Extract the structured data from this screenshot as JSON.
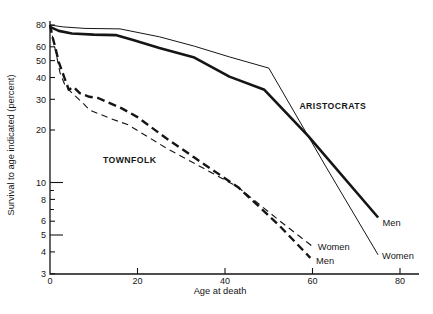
{
  "chart_data": {
    "type": "line",
    "title": "",
    "xlabel": "Age at death",
    "ylabel": "Survival to age indicated (percent)",
    "x_scale": "linear",
    "y_scale": "log",
    "xlim": [
      0,
      84
    ],
    "ylim": [
      3,
      80
    ],
    "x_ticks": [
      0,
      20,
      40,
      60,
      80
    ],
    "y_ticks": [
      80,
      60,
      50,
      40,
      30,
      20,
      10,
      8,
      6,
      5,
      4,
      3
    ],
    "y_long_ticks": [
      10,
      5
    ],
    "y_minor_ticks": [
      9,
      7
    ],
    "grid": false,
    "line_color": "#151515",
    "background_color": "#ffffff",
    "series": [
      {
        "name": "Aristocrats Men",
        "group": "ARISTOCRATS",
        "sex": "Men",
        "line": "solid",
        "weight": "thick",
        "points": [
          [
            0,
            78
          ],
          [
            2,
            74
          ],
          [
            5,
            71.5
          ],
          [
            10,
            70.5
          ],
          [
            15,
            70
          ],
          [
            19,
            65.5
          ],
          [
            25,
            59
          ],
          [
            33,
            52
          ],
          [
            41,
            40.5
          ],
          [
            49,
            34
          ],
          [
            59,
            18.5
          ],
          [
            75,
            6.3
          ]
        ]
      },
      {
        "name": "Aristocrats Women",
        "group": "ARISTOCRATS",
        "sex": "Women",
        "line": "solid",
        "weight": "thin",
        "points": [
          [
            0,
            80
          ],
          [
            3,
            78
          ],
          [
            8,
            76.5
          ],
          [
            16,
            76
          ],
          [
            25,
            68.5
          ],
          [
            33,
            60.5
          ],
          [
            41,
            52.5
          ],
          [
            50,
            45.3
          ],
          [
            63,
            12.4
          ],
          [
            75,
            3.85
          ]
        ]
      },
      {
        "name": "Townfolk Men",
        "group": "TOWNFOLK",
        "sex": "Men",
        "line": "dashed",
        "weight": "thick",
        "points": [
          [
            0,
            80
          ],
          [
            0.6,
            68
          ],
          [
            1.1,
            61
          ],
          [
            2,
            49
          ],
          [
            3.2,
            40.5
          ],
          [
            4.3,
            34
          ],
          [
            5.4,
            35.3
          ],
          [
            6.8,
            32.5
          ],
          [
            9,
            31
          ],
          [
            11,
            30.5
          ],
          [
            13,
            29
          ],
          [
            16.3,
            26.7
          ],
          [
            20,
            23.7
          ],
          [
            26.5,
            18
          ],
          [
            33,
            13.9
          ],
          [
            39,
            11
          ],
          [
            43,
            9.4
          ],
          [
            48,
            7.2
          ],
          [
            52.6,
            5.6
          ],
          [
            59.5,
            3.7
          ]
        ]
      },
      {
        "name": "Townfolk Women",
        "group": "TOWNFOLK",
        "sex": "Women",
        "line": "dashed",
        "weight": "thin",
        "points": [
          [
            0,
            80
          ],
          [
            0.5,
            70
          ],
          [
            1.6,
            51.8
          ],
          [
            2.3,
            42.4
          ],
          [
            3.4,
            36.2
          ],
          [
            5,
            32.6
          ],
          [
            7.3,
            28.9
          ],
          [
            9.1,
            26
          ],
          [
            13.6,
            23.4
          ],
          [
            17.9,
            21.4
          ],
          [
            26.5,
            15.8
          ],
          [
            35,
            12.1
          ],
          [
            43,
            9.4
          ],
          [
            52.6,
            6
          ],
          [
            60,
            4.3
          ]
        ]
      }
    ],
    "annotations": [
      {
        "text": "ARISTOCRATS",
        "age": 57,
        "value": 27.5,
        "kind": "group"
      },
      {
        "text": "TOWNFOLK",
        "age": 12.1,
        "value": 13.5,
        "kind": "group"
      },
      {
        "text": "Men",
        "age": 76,
        "value": 5.85,
        "kind": "series",
        "series": "Aristocrats Men"
      },
      {
        "text": "Women",
        "age": 75.9,
        "value": 3.8,
        "kind": "series",
        "series": "Aristocrats Women"
      },
      {
        "text": "Women",
        "age": 61.2,
        "value": 4.25,
        "kind": "series",
        "series": "Townfolk Women"
      },
      {
        "text": "Men",
        "age": 60.8,
        "value": 3.55,
        "kind": "series",
        "series": "Townfolk Men"
      }
    ]
  }
}
